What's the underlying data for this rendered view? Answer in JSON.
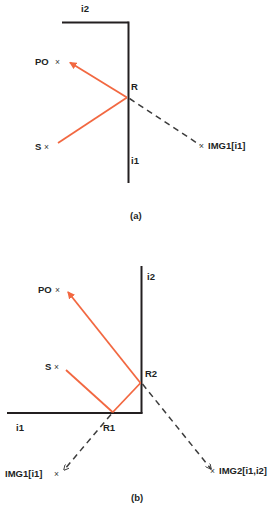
{
  "figure": {
    "colors": {
      "ray": "#F26841",
      "surface": "#231f20",
      "image_ray": "#3c3c3c",
      "text": "#221f1f"
    },
    "panels": [
      {
        "caption": "(a)",
        "axis_labels": {
          "vertical": "i1",
          "horizontal": "i2"
        },
        "points": [
          {
            "name": "PO",
            "label": "PO",
            "marker": "×"
          },
          {
            "name": "S",
            "label": "S",
            "marker": "×"
          },
          {
            "name": "R",
            "label": "R",
            "marker": ""
          },
          {
            "name": "IMG1",
            "label": "IMG1[i1]",
            "marker": "×"
          }
        ]
      },
      {
        "caption": "(b)",
        "axis_labels": {
          "vertical": "i2",
          "horizontal": "i1"
        },
        "points": [
          {
            "name": "PO",
            "label": "PO",
            "marker": "×"
          },
          {
            "name": "S",
            "label": "S",
            "marker": "×"
          },
          {
            "name": "R1",
            "label": "R1",
            "marker": ""
          },
          {
            "name": "R2",
            "label": "R2",
            "marker": ""
          },
          {
            "name": "IMG1",
            "label": "IMG1[i1]",
            "marker": "×"
          },
          {
            "name": "IMG2",
            "label": "IMG2[i1,i2]",
            "marker": "×"
          }
        ]
      }
    ]
  }
}
